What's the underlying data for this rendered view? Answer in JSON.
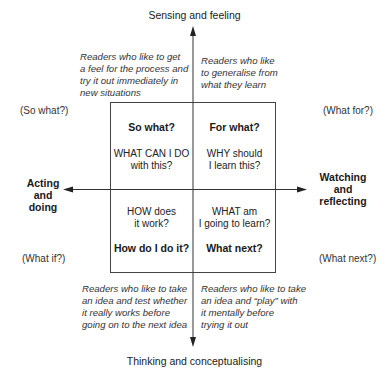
{
  "axes": {
    "top": "Sensing and feeling",
    "bottom": "Thinking and conceptualising",
    "left": "Acting\nand\ndoing",
    "right": "Watching\nand\nreflecting"
  },
  "corner_questions": {
    "top_left": "(So what?)",
    "top_right": "(What for?)",
    "bottom_left": "(What if?)",
    "bottom_right": "(What next?)"
  },
  "reader_descriptions": {
    "top_left": "Readers who like to get\na feel for the process and\ntry it out immediately in\nnew situations",
    "top_right": "Readers who like\nto generalise from\nwhat they learn",
    "bottom_left": "Readers who like to take\nan idea and test whether\nit really works before\ngoing on to the next idea",
    "bottom_right": "Readers who like to take\nan idea and “play” with\nit mentally before\ntrying it out"
  },
  "quadrants": {
    "top_left": {
      "title": "So what?",
      "text": "WHAT CAN I DO\nwith this?"
    },
    "top_right": {
      "title": "For what?",
      "text": "WHY should\nI learn this?"
    },
    "bottom_left": {
      "title": "How do I do it?",
      "text": "HOW does\nit work?"
    },
    "bottom_right": {
      "title": "What next?",
      "text": "WHAT am\nI going to learn?"
    }
  },
  "colors": {
    "line": "#333333",
    "text": "#1a1a1a"
  }
}
